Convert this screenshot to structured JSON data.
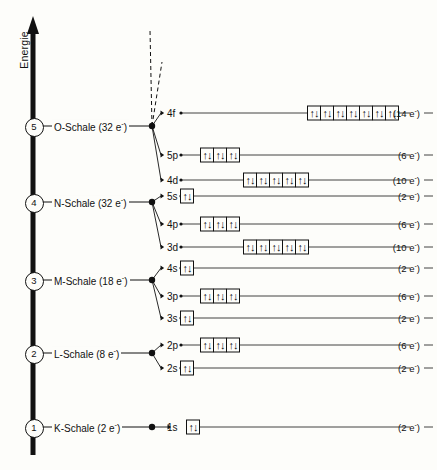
{
  "figure": {
    "axis_label": "Energie",
    "background": "#fdfdfa",
    "ink": "#111111"
  },
  "shells": [
    {
      "number": "5",
      "label": "O-Schale (32 e",
      "sup": "-",
      "label_tail": ")",
      "y": 126
    },
    {
      "number": "4",
      "label": "N-Schale (32 e",
      "sup": "-",
      "label_tail": ")",
      "y": 202
    },
    {
      "number": "3",
      "label": "M-Schale (18 e",
      "sup": "-",
      "label_tail": ")",
      "y": 280
    },
    {
      "number": "2",
      "label": "L-Schale (8 e",
      "sup": "-",
      "label_tail": ")",
      "y": 353
    },
    {
      "number": "1",
      "label": "K-Schale (2 e",
      "sup": "-",
      "label_tail": ")",
      "y": 427
    }
  ],
  "orbitals": [
    {
      "name": "4f",
      "y": 113,
      "boxes": 7,
      "capacity": "(14 e",
      "cap_sup": "-",
      "cap_tail": ")",
      "box_left": 307,
      "line_from": 165,
      "shell": "5"
    },
    {
      "name": "5p",
      "y": 155,
      "boxes": 3,
      "capacity": "(6 e",
      "cap_sup": "-",
      "cap_tail": ")",
      "box_left": 200,
      "line_from": 165,
      "shell": "5"
    },
    {
      "name": "4d",
      "y": 180,
      "boxes": 5,
      "capacity": "(10 e",
      "cap_sup": "-",
      "cap_tail": ")",
      "box_left": 243,
      "line_from": 165,
      "shell": "5"
    },
    {
      "name": "5s",
      "y": 196,
      "boxes": 1,
      "capacity": "(2 e",
      "cap_sup": "-",
      "cap_tail": ")",
      "box_left": 180,
      "line_from": 165,
      "shell": "4"
    },
    {
      "name": "4p",
      "y": 224,
      "boxes": 3,
      "capacity": "(6 e",
      "cap_sup": "-",
      "cap_tail": ")",
      "box_left": 200,
      "line_from": 165,
      "shell": "4"
    },
    {
      "name": "3d",
      "y": 247,
      "boxes": 5,
      "capacity": "(10 e",
      "cap_sup": "-",
      "cap_tail": ")",
      "box_left": 243,
      "line_from": 165,
      "shell": "4"
    },
    {
      "name": "4s",
      "y": 268,
      "boxes": 1,
      "capacity": "(2 e",
      "cap_sup": "-",
      "cap_tail": ")",
      "box_left": 180,
      "line_from": 165,
      "shell": "3"
    },
    {
      "name": "3p",
      "y": 296,
      "boxes": 3,
      "capacity": "(6 e",
      "cap_sup": "-",
      "cap_tail": ")",
      "box_left": 200,
      "line_from": 165,
      "shell": "3"
    },
    {
      "name": "3s",
      "y": 318,
      "boxes": 1,
      "capacity": "(2 e",
      "cap_sup": "-",
      "cap_tail": ")",
      "box_left": 180,
      "line_from": 165,
      "shell": "3"
    },
    {
      "name": "2p",
      "y": 345,
      "boxes": 3,
      "capacity": "(6 e",
      "cap_sup": "-",
      "cap_tail": ")",
      "box_left": 200,
      "line_from": 165,
      "shell": "2"
    },
    {
      "name": "2s",
      "y": 368,
      "boxes": 1,
      "capacity": "(2 e",
      "cap_sup": "-",
      "cap_tail": ")",
      "box_left": 180,
      "line_from": 165,
      "shell": "2"
    },
    {
      "name": "1s",
      "y": 427,
      "boxes": 1,
      "capacity": "(2 e",
      "cap_sup": "-",
      "cap_tail": ")",
      "box_left": 186,
      "line_from": 172,
      "shell": "1"
    }
  ],
  "electron_pair_glyph": "↑↓",
  "geometry": {
    "axis_x": 33,
    "shell_name_x": 52,
    "node_x": 152,
    "orb_label_x": 167,
    "line_end_x": 410,
    "cap_label_x": 424
  }
}
